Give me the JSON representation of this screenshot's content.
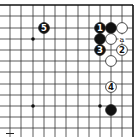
{
  "diagram": {
    "type": "go-board-partial",
    "grid": {
      "x_lines": [
        10,
        21,
        33,
        44,
        55,
        66,
        78,
        89,
        100,
        111,
        122,
        133
      ],
      "y_lines": [
        5,
        16,
        28,
        39,
        50,
        61,
        72,
        84,
        95,
        106,
        117,
        128
      ],
      "top_edge_y": 5,
      "right_edge_x": 133,
      "line_color": "#333333",
      "edge_color": "#111111"
    },
    "star_points": [
      {
        "x": 33,
        "y": 39
      },
      {
        "x": 33,
        "y": 106
      },
      {
        "x": 100,
        "y": 106
      }
    ],
    "stones": [
      {
        "color": "black",
        "x": 100,
        "y": 28,
        "label": "1"
      },
      {
        "color": "black",
        "x": 111,
        "y": 28,
        "label": ""
      },
      {
        "color": "white",
        "x": 122,
        "y": 28,
        "label": ""
      },
      {
        "color": "black",
        "x": 100,
        "y": 39,
        "label": ""
      },
      {
        "color": "white",
        "x": 111,
        "y": 39,
        "label": ""
      },
      {
        "color": "black",
        "x": 100,
        "y": 50,
        "label": "3"
      },
      {
        "color": "white",
        "x": 122,
        "y": 50,
        "label": "2"
      },
      {
        "color": "white",
        "x": 111,
        "y": 61,
        "label": ""
      },
      {
        "color": "white",
        "x": 111,
        "y": 87,
        "label": "4"
      },
      {
        "color": "black",
        "x": 111,
        "y": 110,
        "label": ""
      },
      {
        "color": "black",
        "x": 44,
        "y": 28,
        "label": "5"
      }
    ],
    "markers": [
      {
        "x": 122,
        "y": 39,
        "text": "a"
      }
    ],
    "colors": {
      "black_stone": "#111111",
      "white_stone": "#ffffff",
      "stone_outline": "#222222"
    }
  }
}
